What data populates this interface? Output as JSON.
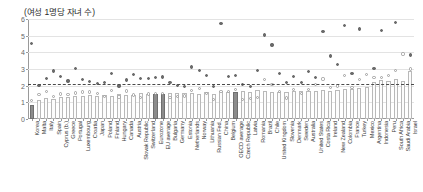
{
  "chart_data": {
    "type": "bar",
    "title": "(여성 1명당 자녀 수)",
    "xlabel": "",
    "ylabel": "",
    "ylim": [
      0,
      6
    ],
    "yticks": [
      0,
      1,
      2,
      3,
      4,
      5,
      6
    ],
    "grid": true,
    "legend_position": "none",
    "reference_line": {
      "value": 2.1,
      "style": "dashed",
      "label": ""
    },
    "categories": [
      "Korea",
      "Malta",
      "Italy",
      "Spain",
      "Cyprus (b.)",
      "Greece",
      "Portugal",
      "Luxembourg",
      "Croatia",
      "Japan",
      "Poland",
      "Finland",
      "Hungary",
      "Canada",
      "Austria",
      "Slovak Republic",
      "Switzerland",
      "Eurozone",
      "EU average",
      "Bulgaria",
      "Germany",
      "Estonia",
      "Netherlands",
      "Norway",
      "Lithuania",
      "Russian Fed.",
      "China",
      "Belgium",
      "OECD average",
      "Czech Republic",
      "Latvia",
      "Romania",
      "Brazil",
      "Chile",
      "United Kingdom",
      "Slovenia",
      "Denmark",
      "Sweden",
      "Australia",
      "United States",
      "Costa Rica",
      "Ireland",
      "New Zealand",
      "Colombia",
      "France",
      "Turkey",
      "Mexico",
      "Argentina",
      "Indonesia",
      "Peru",
      "South Africa",
      "Saudi Arabia",
      "Israel"
    ],
    "highlight_categories": [
      "Korea",
      "Eurozone",
      "EU average",
      "OECD average"
    ],
    "series": [
      {
        "name": "current",
        "type": "bar",
        "values": [
          0.84,
          1.14,
          1.24,
          1.23,
          1.33,
          1.34,
          1.38,
          1.38,
          1.47,
          1.36,
          1.44,
          1.37,
          1.49,
          1.47,
          1.46,
          1.57,
          1.48,
          1.5,
          1.53,
          1.56,
          1.54,
          1.58,
          1.57,
          1.53,
          1.61,
          1.5,
          1.7,
          1.6,
          1.61,
          1.71,
          1.61,
          1.77,
          1.71,
          1.65,
          1.63,
          1.61,
          1.7,
          1.71,
          1.66,
          1.71,
          1.76,
          1.71,
          1.72,
          1.82,
          1.83,
          1.88,
          1.94,
          2.25,
          2.32,
          2.27,
          2.4,
          2.28,
          2.9
        ]
      },
      {
        "name": "mid",
        "type": "scatter",
        "marker": "open-circle",
        "values": [
          1.09,
          1.48,
          1.64,
          1.36,
          1.5,
          1.48,
          1.56,
          1.62,
          1.62,
          1.54,
          1.35,
          1.73,
          1.32,
          1.68,
          1.44,
          1.3,
          1.5,
          1.53,
          1.54,
          1.27,
          1.36,
          1.38,
          1.72,
          1.85,
          1.55,
          1.19,
          1.63,
          1.67,
          1.75,
          1.15,
          1.25,
          1.31,
          2.39,
          2.05,
          1.64,
          1.26,
          1.77,
          1.54,
          1.76,
          2.06,
          2.4,
          1.89,
          1.98,
          2.6,
          1.89,
          2.38,
          2.67,
          2.5,
          2.5,
          2.6,
          2.9,
          3.9,
          3.0
        ]
      },
      {
        "name": "historical",
        "type": "scatter",
        "marker": "filled-circle",
        "values": [
          4.53,
          2.02,
          2.42,
          2.88,
          2.53,
          2.28,
          3.01,
          2.37,
          2.25,
          2.13,
          2.2,
          2.72,
          1.98,
          2.34,
          2.69,
          2.41,
          2.44,
          2.5,
          2.52,
          2.18,
          2.03,
          1.94,
          3.12,
          2.91,
          2.59,
          1.97,
          5.75,
          2.56,
          2.63,
          2.09,
          1.94,
          2.89,
          5.04,
          4.44,
          2.72,
          2.21,
          2.57,
          2.2,
          2.86,
          2.48,
          5.25,
          3.78,
          3.29,
          5.6,
          2.73,
          5.4,
          6.7,
          3.05,
          5.3,
          6.2,
          5.8,
          7.2,
          3.84
        ]
      }
    ]
  }
}
